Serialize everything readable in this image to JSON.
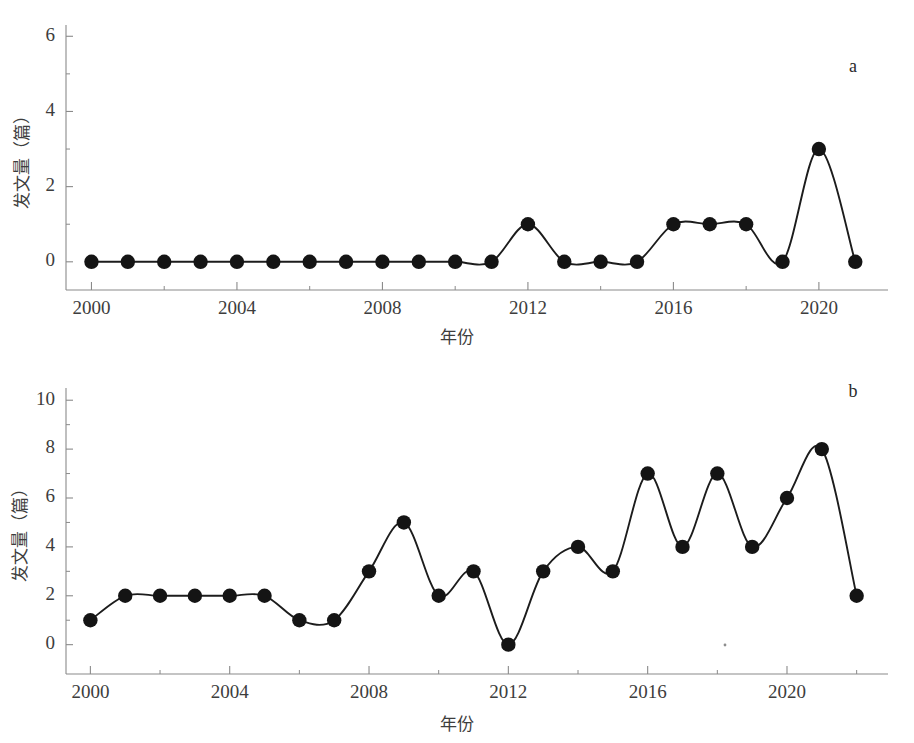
{
  "figure": {
    "clipped_header_text": "",
    "background_color": "#ffffff",
    "line_color": "#1c1c1c",
    "marker_color": "#141414",
    "axis_color": "#8a8a8a",
    "text_color": "#3d3d3d"
  },
  "panels": [
    {
      "id": "a",
      "letter": "a",
      "xlabel": "年份",
      "ylabel": "发文量（篇）",
      "y_ticks": [
        "0",
        "2",
        "4",
        "6"
      ],
      "x_ticks": [
        "2000",
        "2004",
        "2008",
        "2012",
        "2016",
        "2020"
      ]
    },
    {
      "id": "b",
      "letter": "b",
      "xlabel": "年份",
      "ylabel": "发文量（篇）",
      "y_ticks": [
        "0",
        "2",
        "4",
        "6",
        "8",
        "10"
      ],
      "x_ticks": [
        "2000",
        "2004",
        "2008",
        "2012",
        "2016",
        "2020"
      ]
    }
  ],
  "chart_data": [
    {
      "type": "line",
      "panel": "a",
      "title": "",
      "xlabel": "年份",
      "ylabel": "发文量（篇）",
      "annotation": "a",
      "grid": false,
      "legend": false,
      "xlim": [
        1999.3,
        2021.9
      ],
      "ylim": [
        -0.75,
        6.3
      ],
      "y_major_ticks": [
        0,
        2,
        4,
        6
      ],
      "y_minor_ticks": [
        1,
        3,
        5
      ],
      "x_major_ticks": [
        2000,
        2004,
        2008,
        2012,
        2016,
        2020
      ],
      "x_minor_ticks": [
        2002,
        2006,
        2010,
        2014,
        2018
      ],
      "x_tick_labels": [
        "2000",
        "2004",
        "2008",
        "2012",
        "2016",
        "2020"
      ],
      "y_tick_labels": [
        "0",
        "2",
        "4",
        "6"
      ],
      "x": [
        2000,
        2001,
        2002,
        2003,
        2004,
        2005,
        2006,
        2007,
        2008,
        2009,
        2010,
        2011,
        2012,
        2013,
        2014,
        2015,
        2016,
        2017,
        2018,
        2019,
        2020,
        2021
      ],
      "values": [
        0,
        0,
        0,
        0,
        0,
        0,
        0,
        0,
        0,
        0,
        0,
        0,
        1,
        0,
        0,
        0,
        1,
        1,
        1,
        0,
        3,
        0
      ]
    },
    {
      "type": "line",
      "panel": "b",
      "title": "",
      "xlabel": "年份",
      "ylabel": "发文量（篇）",
      "annotation": "b",
      "grid": false,
      "legend": false,
      "xlim": [
        1999.3,
        2022.9
      ],
      "ylim": [
        -1.2,
        10.5
      ],
      "y_major_ticks": [
        0,
        2,
        4,
        6,
        8,
        10
      ],
      "y_minor_ticks": [
        1,
        3,
        5,
        7,
        9
      ],
      "x_major_ticks": [
        2000,
        2004,
        2008,
        2012,
        2016,
        2020
      ],
      "x_minor_ticks": [
        2002,
        2006,
        2010,
        2014,
        2018,
        2022
      ],
      "x_tick_labels": [
        "2000",
        "2004",
        "2008",
        "2012",
        "2016",
        "2020"
      ],
      "y_tick_labels": [
        "0",
        "2",
        "4",
        "6",
        "8",
        "10"
      ],
      "x": [
        2000,
        2001,
        2002,
        2003,
        2004,
        2005,
        2006,
        2007,
        2008,
        2009,
        2010,
        2011,
        2012,
        2013,
        2014,
        2015,
        2016,
        2017,
        2018,
        2019,
        2020,
        2021,
        2022
      ],
      "values": [
        1,
        2,
        2,
        2,
        2,
        2,
        1,
        1,
        3,
        5,
        2,
        3,
        0,
        3,
        4,
        3,
        7,
        4,
        7,
        4,
        6,
        8,
        2
      ]
    }
  ]
}
